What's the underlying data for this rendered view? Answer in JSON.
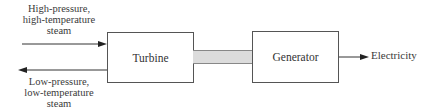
{
  "diagram": {
    "input_label": [
      "High-pressure,",
      "high-temperature",
      "steam"
    ],
    "output_label": [
      "Low-pressure,",
      "low-temperature",
      "steam"
    ],
    "turbine_label": "Turbine",
    "generator_label": "Generator",
    "electricity_label": "Electricity",
    "colors": {
      "line": "#333333",
      "shaft_fill": "#dcdcdc",
      "box_border": "#555555"
    }
  }
}
